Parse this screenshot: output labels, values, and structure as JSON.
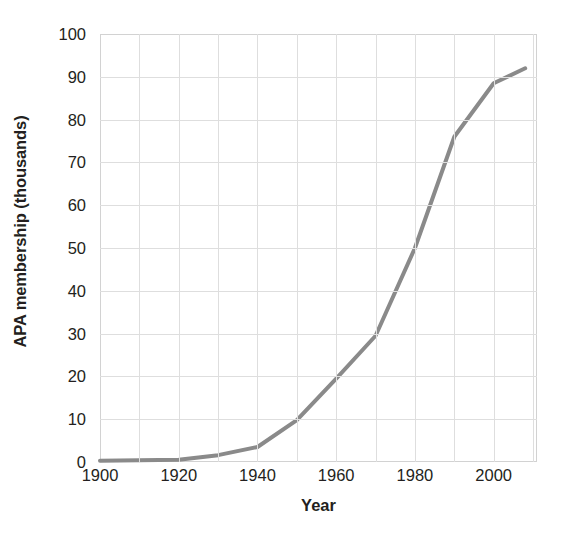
{
  "chart_data": {
    "type": "line",
    "title": "",
    "xlabel": "Year",
    "ylabel": "APA membership (thousands)",
    "xlim": [
      1900,
      2011
    ],
    "ylim": [
      0,
      100
    ],
    "xticks": [
      1900,
      1920,
      1940,
      1960,
      1980,
      2000
    ],
    "xtick_labels": [
      "1900",
      "1920",
      "1940",
      "1960",
      "1980",
      "2000"
    ],
    "yticks": [
      0,
      10,
      20,
      30,
      40,
      50,
      60,
      70,
      80,
      90,
      100
    ],
    "ytick_labels": [
      "0",
      "10",
      "20",
      "30",
      "40",
      "50",
      "60",
      "70",
      "80",
      "90",
      "100"
    ],
    "x_minor_step": 10,
    "y_minor_step": 10,
    "grid": true,
    "legend": false,
    "series": [
      {
        "name": "APA membership",
        "color": "#8a8a8a",
        "line_width": 4,
        "x": [
          1900,
          1910,
          1920,
          1930,
          1940,
          1950,
          1960,
          1970,
          1980,
          1990,
          2000,
          2008
        ],
        "values": [
          0.3,
          0.4,
          0.5,
          1.6,
          3.5,
          9.8,
          19.5,
          29.5,
          50.0,
          76.0,
          88.5,
          92.0
        ]
      }
    ]
  },
  "axis": {
    "y_title": "APA membership (thousands)",
    "x_title": "Year"
  },
  "colors": {
    "line": "#8a8a8a",
    "grid": "#dedede",
    "axis": "#d2d2d2",
    "text": "#231f20",
    "background": "#ffffff"
  }
}
